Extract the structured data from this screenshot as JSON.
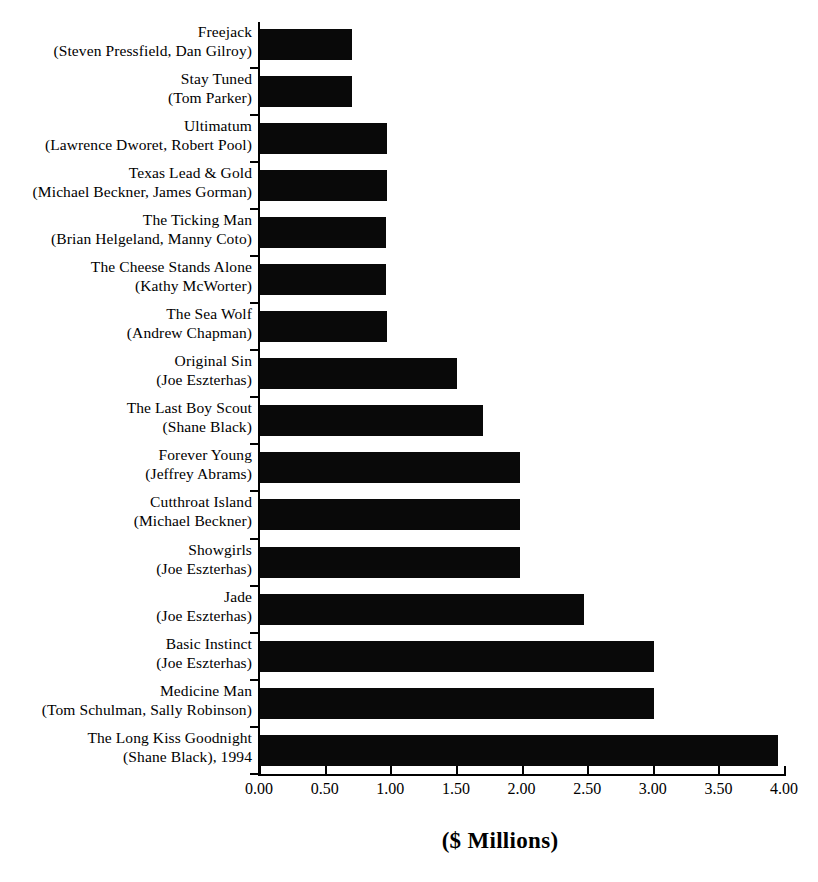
{
  "chart_data": {
    "type": "bar",
    "orientation": "horizontal",
    "title": "",
    "xlabel": "($ Millions)",
    "ylabel": "",
    "xlim": [
      0.0,
      4.0
    ],
    "xticks": [
      "0.00",
      "0.50",
      "1.00",
      "1.50",
      "2.00",
      "2.50",
      "3.00",
      "3.50",
      "4.00"
    ],
    "xtick_values": [
      0.0,
      0.5,
      1.0,
      1.5,
      2.0,
      2.5,
      3.0,
      3.5,
      4.0
    ],
    "grid": false,
    "legend": null,
    "bar_color": "#000000",
    "background_color": "#ffffff",
    "categories": [
      "Freejack (Steven Pressfield, Dan Gilroy)",
      "Stay Tuned (Tom Parker)",
      "Ultimatum (Lawrence Dworet, Robert Pool)",
      "Texas Lead & Gold (Michael Beckner, James Gorman)",
      "The Ticking Man (Brian Helgeland, Manny Coto)",
      "The Cheese Stands Alone (Kathy McWorter)",
      "The Sea Wolf (Andrew Chapman)",
      "Original Sin (Joe Eszterhas)",
      "The Last Boy Scout (Shane Black)",
      "Forever Young (Jeffrey Abrams)",
      "Cutthroat Island (Michael Beckner)",
      "Showgirls (Joe Eszterhas)",
      "Jade (Joe Eszterhas)",
      "Basic Instinct (Joe Eszterhas)",
      "Medicine Man (Tom Schulman, Sally Robinson)",
      "The Long Kiss Goodnight (Shane Black), 1994"
    ],
    "values": [
      0.7,
      0.7,
      0.97,
      0.97,
      0.96,
      0.96,
      0.97,
      1.5,
      1.7,
      1.98,
      1.98,
      1.98,
      2.47,
      3.0,
      3.0,
      3.95
    ]
  },
  "rows": [
    {
      "title": "Freejack",
      "credit": "(Steven Pressfield, Dan Gilroy)",
      "value": 0.7
    },
    {
      "title": "Stay Tuned",
      "credit": "(Tom Parker)",
      "value": 0.7
    },
    {
      "title": "Ultimatum",
      "credit": "(Lawrence Dworet, Robert Pool)",
      "value": 0.97
    },
    {
      "title": "Texas Lead & Gold",
      "credit": "(Michael Beckner, James Gorman)",
      "value": 0.97
    },
    {
      "title": "The Ticking Man",
      "credit": "(Brian Helgeland, Manny Coto)",
      "value": 0.96
    },
    {
      "title": "The Cheese Stands Alone",
      "credit": "(Kathy McWorter)",
      "value": 0.96
    },
    {
      "title": "The Sea Wolf",
      "credit": "(Andrew Chapman)",
      "value": 0.97
    },
    {
      "title": "Original Sin",
      "credit": "(Joe Eszterhas)",
      "value": 1.5
    },
    {
      "title": "The Last Boy Scout",
      "credit": "(Shane Black)",
      "value": 1.7
    },
    {
      "title": "Forever Young",
      "credit": "(Jeffrey Abrams)",
      "value": 1.98
    },
    {
      "title": "Cutthroat Island",
      "credit": "(Michael Beckner)",
      "value": 1.98
    },
    {
      "title": "Showgirls",
      "credit": "(Joe Eszterhas)",
      "value": 1.98
    },
    {
      "title": "Jade",
      "credit": "(Joe Eszterhas)",
      "value": 2.47
    },
    {
      "title": "Basic Instinct",
      "credit": "(Joe Eszterhas)",
      "value": 3.0
    },
    {
      "title": "Medicine Man",
      "credit": "(Tom Schulman, Sally Robinson)",
      "value": 3.0
    },
    {
      "title": "The Long Kiss Goodnight",
      "credit": "(Shane Black), 1994",
      "value": 3.95
    }
  ],
  "axis": {
    "title": "($ Millions)",
    "ticks": [
      "0.00",
      "0.50",
      "1.00",
      "1.50",
      "2.00",
      "2.50",
      "3.00",
      "3.50",
      "4.00"
    ]
  }
}
